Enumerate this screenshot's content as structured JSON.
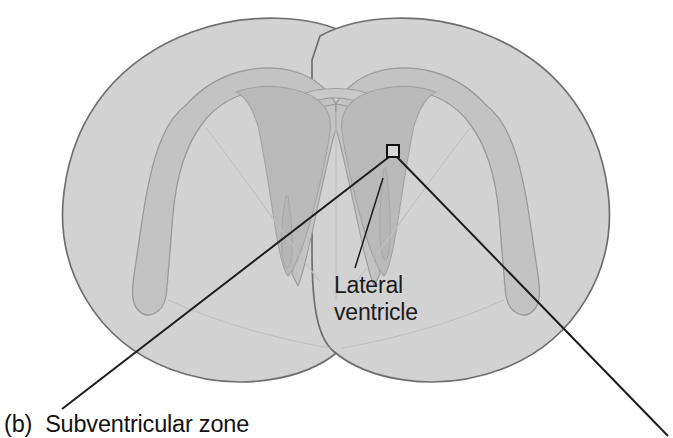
{
  "figure": {
    "name": "brain-coronal-section-subventricular-zone",
    "panel_letter": "(b)",
    "caption": "Subventricular zone",
    "annotations": {
      "lateral_ventricle_line1": "Lateral",
      "lateral_ventricle_line2": "ventricle"
    },
    "callout": {
      "name": "magnification-box",
      "note": "small square marker on right subventricular zone with two guide lines"
    },
    "colors": {
      "background": "#ffffff",
      "hemisphere_fill": "#d2d2d2",
      "hemisphere_stroke": "#6f6f6f",
      "subventricular_zone_fill": "#c3c3c3",
      "subventricular_zone_stroke": "#9a9a9a",
      "ventricle_fill": "#b9b9b9",
      "ventricle_stroke": "#a3a3a3",
      "leader_line": "#1d1d1d",
      "text": "#1b1b1b"
    },
    "regions": [
      {
        "name": "left-hemisphere",
        "label": ""
      },
      {
        "name": "right-hemisphere",
        "label": ""
      },
      {
        "name": "left-subventricular-zone",
        "label": ""
      },
      {
        "name": "right-subventricular-zone",
        "label": ""
      },
      {
        "name": "left-lateral-ventricle",
        "label": ""
      },
      {
        "name": "right-lateral-ventricle",
        "label": ""
      }
    ]
  }
}
